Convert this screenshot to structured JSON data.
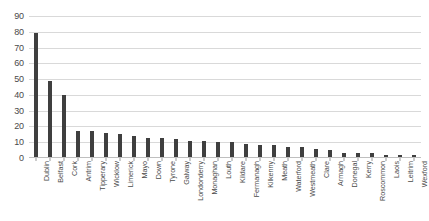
{
  "chart_data": {
    "type": "bar",
    "title": "",
    "subtitle": "",
    "xlabel": "",
    "ylabel": "",
    "ylim": [
      0,
      90
    ],
    "ytick_step": 10,
    "grid": true,
    "legend": null,
    "legend_position": "none",
    "orientation": "vertical",
    "bar_color": "#3f3f3f",
    "gridline_color": "#d9d9d9",
    "axis_color": "#bfbfbf",
    "label_color": "#4a4a4a",
    "yticks": [
      0,
      10,
      20,
      30,
      40,
      50,
      60,
      70,
      80,
      90
    ],
    "ytick_labels": [
      "0",
      "10",
      "20",
      "30",
      "40",
      "50",
      "60",
      "70",
      "80",
      "90"
    ],
    "categories": [
      "Dublin",
      "Belfast",
      "Cork",
      "Antrim",
      "Tipperary",
      "Wicklow",
      "Limerick",
      "Mayo",
      "Down",
      "Tyrone",
      "Galway",
      "Londonderry",
      "Monaghan",
      "Louth",
      "Kildare",
      "Fermanagh",
      "Kilkenny",
      "Meath",
      "Waterford",
      "Westmeath",
      "Clare",
      "Armagh",
      "Donegal",
      "Kerry",
      "Roscommon",
      "Laois",
      "Leitrim",
      "Wexford"
    ],
    "values": [
      79,
      49,
      40,
      17,
      17,
      16,
      15,
      14,
      13,
      13,
      12,
      11,
      11,
      10,
      10,
      9,
      8,
      8,
      7,
      7,
      6,
      5,
      3,
      3,
      3,
      2,
      2,
      2
    ]
  }
}
